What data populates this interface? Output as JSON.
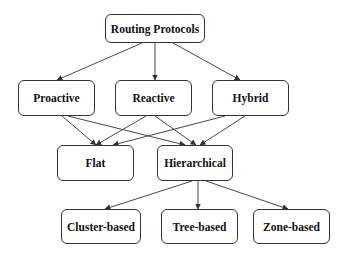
{
  "diagram": {
    "type": "tree-taxonomy",
    "nodes": [
      {
        "id": "routing",
        "label": "Routing Protocols",
        "x": 105,
        "y": 14,
        "w": 100,
        "h": 29
      },
      {
        "id": "proactive",
        "label": "Proactive",
        "x": 18,
        "y": 80,
        "w": 77,
        "h": 36
      },
      {
        "id": "reactive",
        "label": "Reactive",
        "x": 115,
        "y": 80,
        "w": 77,
        "h": 36
      },
      {
        "id": "hybrid",
        "label": "Hybrid",
        "x": 212,
        "y": 80,
        "w": 77,
        "h": 36
      },
      {
        "id": "flat",
        "label": "Flat",
        "x": 57,
        "y": 145,
        "w": 77,
        "h": 36
      },
      {
        "id": "hierarchical",
        "label": "Hierarchical",
        "x": 157,
        "y": 145,
        "w": 76,
        "h": 36
      },
      {
        "id": "cluster",
        "label": "Cluster-based",
        "x": 61,
        "y": 209,
        "w": 80,
        "h": 35
      },
      {
        "id": "tree",
        "label": "Tree-based",
        "x": 161,
        "y": 209,
        "w": 77,
        "h": 35
      },
      {
        "id": "zone",
        "label": "Zone-based",
        "x": 253,
        "y": 209,
        "w": 77,
        "h": 35
      }
    ],
    "edges": [
      {
        "from": "routing",
        "to": "proactive",
        "x1": 142,
        "y1": 43,
        "x2": 57,
        "y2": 80
      },
      {
        "from": "routing",
        "to": "reactive",
        "x1": 155,
        "y1": 43,
        "x2": 155,
        "y2": 80
      },
      {
        "from": "routing",
        "to": "hybrid",
        "x1": 173,
        "y1": 43,
        "x2": 240,
        "y2": 80
      },
      {
        "from": "proactive",
        "to": "flat",
        "x1": 62,
        "y1": 116,
        "x2": 96,
        "y2": 145
      },
      {
        "from": "proactive",
        "to": "hierarchical",
        "x1": 68,
        "y1": 116,
        "x2": 185,
        "y2": 145
      },
      {
        "from": "reactive",
        "to": "flat",
        "x1": 146,
        "y1": 116,
        "x2": 96,
        "y2": 145
      },
      {
        "from": "reactive",
        "to": "hierarchical",
        "x1": 155,
        "y1": 116,
        "x2": 196,
        "y2": 145
      },
      {
        "from": "hybrid",
        "to": "flat",
        "x1": 225,
        "y1": 116,
        "x2": 113,
        "y2": 145
      },
      {
        "from": "hybrid",
        "to": "hierarchical",
        "x1": 245,
        "y1": 116,
        "x2": 200,
        "y2": 145
      },
      {
        "from": "hierarchical",
        "to": "cluster",
        "x1": 192,
        "y1": 181,
        "x2": 105,
        "y2": 209
      },
      {
        "from": "hierarchical",
        "to": "tree",
        "x1": 198,
        "y1": 181,
        "x2": 198,
        "y2": 209
      },
      {
        "from": "hierarchical",
        "to": "zone",
        "x1": 206,
        "y1": 181,
        "x2": 288,
        "y2": 209
      }
    ],
    "colors": {
      "stroke": "#333333",
      "text": "#111111",
      "background": "#ffffff"
    }
  }
}
